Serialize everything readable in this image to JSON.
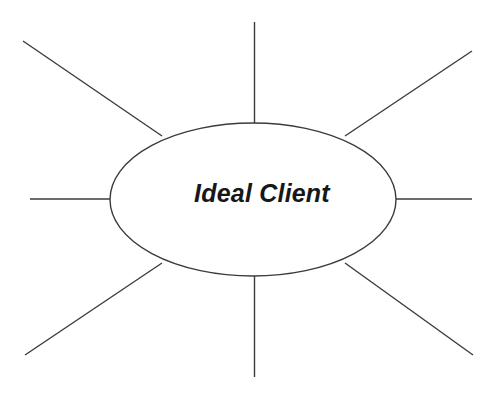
{
  "diagram": {
    "kind": "spider-web-brainstorm-diagram",
    "center_label": "Ideal Client",
    "background_color": "#ffffff",
    "line_color": "#3b3b3b",
    "text_color": "#171717",
    "center_shape": {
      "type": "ellipse",
      "cx": 253,
      "cy": 199.5,
      "rx": 143,
      "ry": 76.5
    },
    "label_position": {
      "x": 262,
      "y": 195
    },
    "spokes": [
      {
        "name": "spoke-top",
        "direction": "up",
        "x1": 254.5,
        "y1": 22,
        "x2": 254.5,
        "y2": 124
      },
      {
        "name": "spoke-top-right",
        "direction": "up-right",
        "x1": 345,
        "y1": 136,
        "x2": 472,
        "y2": 51
      },
      {
        "name": "spoke-right",
        "direction": "right",
        "x1": 395,
        "y1": 199,
        "x2": 472,
        "y2": 199
      },
      {
        "name": "spoke-bottom-right",
        "direction": "down-right",
        "x1": 345,
        "y1": 263,
        "x2": 473,
        "y2": 355
      },
      {
        "name": "spoke-bottom",
        "direction": "down",
        "x1": 254.5,
        "y1": 275,
        "x2": 254.5,
        "y2": 377
      },
      {
        "name": "spoke-bottom-left",
        "direction": "down-left",
        "x1": 162,
        "y1": 263,
        "x2": 25,
        "y2": 355
      },
      {
        "name": "spoke-left",
        "direction": "left",
        "x1": 112,
        "y1": 199,
        "x2": 30,
        "y2": 199
      },
      {
        "name": "spoke-top-left",
        "direction": "up-left",
        "x1": 162,
        "y1": 136,
        "x2": 23,
        "y2": 41
      }
    ]
  }
}
